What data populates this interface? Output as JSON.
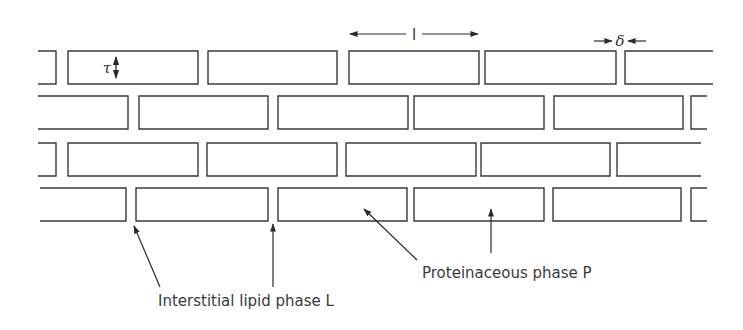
{
  "diagram": {
    "type": "brick-and-mortar model",
    "colors": {
      "stroke": "#3a3a3a",
      "background": "#ffffff",
      "text": "#3a3a3a"
    },
    "rows": [
      {
        "y": 51,
        "h": 33,
        "bricks": [
          {
            "x1": 38,
            "x2": 56,
            "open": "left"
          },
          {
            "x1": 68,
            "x2": 198
          },
          {
            "x1": 208,
            "x2": 337
          },
          {
            "x1": 349,
            "x2": 479
          },
          {
            "x1": 485,
            "x2": 616
          },
          {
            "x1": 625,
            "x2": 713,
            "open": "right"
          }
        ]
      },
      {
        "y": 96,
        "h": 33,
        "bricks": [
          {
            "x1": 38,
            "x2": 128,
            "open": "left"
          },
          {
            "x1": 139,
            "x2": 268
          },
          {
            "x1": 278,
            "x2": 408
          },
          {
            "x1": 414,
            "x2": 544
          },
          {
            "x1": 554,
            "x2": 683
          },
          {
            "x1": 691,
            "x2": 707,
            "open": "right"
          }
        ]
      },
      {
        "y": 143,
        "h": 33,
        "bricks": [
          {
            "x1": 38,
            "x2": 56,
            "open": "left"
          },
          {
            "x1": 68,
            "x2": 198
          },
          {
            "x1": 207,
            "x2": 337
          },
          {
            "x1": 346,
            "x2": 476
          },
          {
            "x1": 481,
            "x2": 610
          },
          {
            "x1": 617,
            "x2": 701,
            "open": "right"
          }
        ]
      },
      {
        "y": 188,
        "h": 33,
        "bricks": [
          {
            "x1": 40,
            "x2": 126,
            "open": "left"
          },
          {
            "x1": 136,
            "x2": 268
          },
          {
            "x1": 278,
            "x2": 407
          },
          {
            "x1": 414,
            "x2": 544
          },
          {
            "x1": 553,
            "x2": 681
          },
          {
            "x1": 691,
            "x2": 707,
            "open": "right"
          }
        ]
      }
    ],
    "dimensions": {
      "tau": {
        "symbol": "τ",
        "x": 116,
        "y1": 53,
        "y2": 82
      },
      "length": {
        "symbol": "l",
        "x1": 350,
        "x2": 478,
        "y": 34
      },
      "delta": {
        "symbol": "δ",
        "x": 620,
        "y": 41
      }
    },
    "annotations": [
      {
        "id": "lipid",
        "text": "Interstitial lipid phase L",
        "x": 158,
        "y": 306,
        "arrows": [
          {
            "from": [
              160,
              287
            ],
            "to": [
              134,
              226
            ]
          },
          {
            "from": [
              273,
              287
            ],
            "to": [
              273,
              224
            ]
          }
        ]
      },
      {
        "id": "protein",
        "text": "Proteinaceous phase P",
        "x": 422,
        "y": 278,
        "arrows": [
          {
            "from": [
              417,
              260
            ],
            "to": [
              364,
              209
            ]
          },
          {
            "from": [
              491,
              253
            ],
            "to": [
              491,
              209
            ]
          }
        ]
      }
    ]
  }
}
